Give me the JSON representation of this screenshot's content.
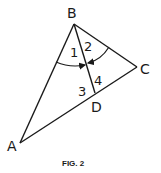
{
  "figure": {
    "caption": "FIG. 2",
    "stroke_color": "#1a1a1a",
    "background": "#ffffff"
  },
  "vertices": {
    "A": {
      "label": "A",
      "x": 20,
      "y": 143
    },
    "B": {
      "label": "B",
      "x": 74,
      "y": 24
    },
    "C": {
      "label": "C",
      "x": 137,
      "y": 67
    },
    "D": {
      "label": "D",
      "x": 95,
      "y": 93
    }
  },
  "segments": [
    "AB",
    "BC",
    "CA",
    "BD"
  ],
  "angle_labels": [
    "1",
    "2",
    "3",
    "4"
  ],
  "arcs": [
    {
      "name": "arc-angle-1",
      "from": "BA",
      "to": "BD",
      "arrow": true
    },
    {
      "name": "arc-angle-2",
      "from": "BC",
      "to": "BD",
      "arrow": true
    }
  ]
}
